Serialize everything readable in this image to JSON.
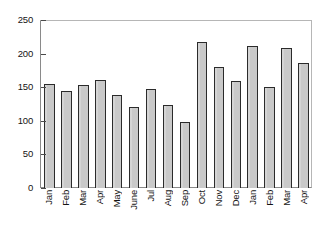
{
  "chart_data": {
    "type": "bar",
    "title": "",
    "subtitle": "",
    "xlabel": "",
    "ylabel": "",
    "categories": [
      "Jan",
      "Feb",
      "Mar",
      "Apr",
      "May",
      "June",
      "Jul",
      "Aug",
      "Sep",
      "Oct",
      "Nov",
      "Dec",
      "Jan",
      "Feb",
      "Mar",
      "Apr"
    ],
    "values": [
      155,
      144,
      154,
      160,
      138,
      120,
      147,
      123,
      98,
      217,
      180,
      159,
      211,
      150,
      208,
      186
    ],
    "ylim": [
      0,
      250
    ],
    "yticks": [
      0,
      50,
      100,
      150,
      200,
      250
    ],
    "ytick_labels": [
      "0",
      "50",
      "100",
      "150",
      "200",
      "250"
    ],
    "xtick_labels": [
      "Jan",
      "Feb",
      "Mar",
      "Apr",
      "May",
      "June",
      "Jul",
      "Aug",
      "Sep",
      "Oct",
      "Nov",
      "Dec",
      "Jan",
      "Feb",
      "Mar",
      "Apr"
    ],
    "grid": false,
    "legend": null,
    "legend_position": "none",
    "series": [
      {
        "name": "series-1",
        "values": [
          155,
          144,
          154,
          160,
          138,
          120,
          147,
          123,
          98,
          217,
          180,
          159,
          211,
          150,
          208,
          186
        ]
      }
    ],
    "bar_fill_color": "#c9c9c9",
    "bar_edge_color": "#2b2b2b",
    "background_color": "#ffffff",
    "axis_color": "#4a4a4a"
  }
}
